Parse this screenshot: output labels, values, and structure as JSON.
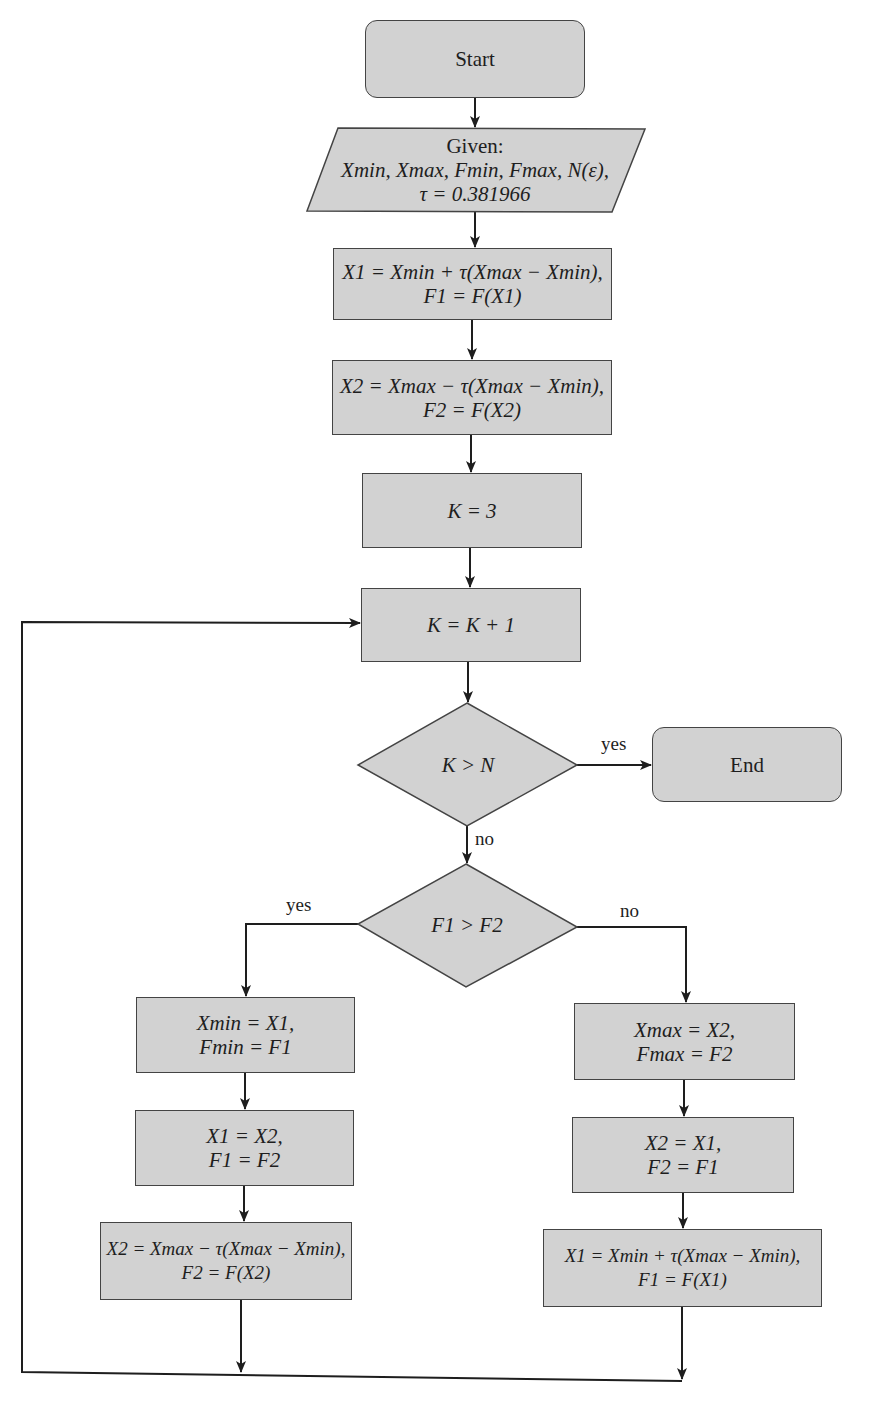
{
  "flowchart": {
    "start": {
      "label": "Start"
    },
    "input": {
      "title": "Given:",
      "line1": "Xmin, Xmax, Fmin, Fmax, N(ε),",
      "line2": "τ = 0.381966"
    },
    "init_x1": {
      "line1": "X1 = Xmin + τ(Xmax − Xmin),",
      "line2": "F1 = F(X1)"
    },
    "init_x2": {
      "line1": "X2 = Xmax − τ(Xmax − Xmin),",
      "line2": "F2 = F(X2)"
    },
    "set_k": {
      "label": "K = 3"
    },
    "increment_k": {
      "label": "K = K + 1"
    },
    "decision_k": {
      "label": "K > N",
      "yes": "yes",
      "no": "no"
    },
    "end": {
      "label": "End"
    },
    "decision_f": {
      "label": "F1 > F2",
      "yes": "yes",
      "no": "no"
    },
    "left_branch": [
      {
        "line1": "Xmin = X1,",
        "line2": "Fmin = F1"
      },
      {
        "line1": "X1 = X2,",
        "line2": "F1 = F2"
      },
      {
        "line1": "X2 = Xmax − τ(Xmax − Xmin),",
        "line2": "F2 = F(X2)"
      }
    ],
    "right_branch": [
      {
        "line1": "Xmax = X2,",
        "line2": "Fmax = F2"
      },
      {
        "line1": "X2 = X1,",
        "line2": "F2 = F1"
      },
      {
        "line1": "X1 = Xmin + τ(Xmax − Xmin),",
        "line2": "F1 = F(X1)"
      }
    ]
  },
  "colors": {
    "fill": "#d2d2d2",
    "stroke": "#444444",
    "wire": "#1e1e1e"
  }
}
